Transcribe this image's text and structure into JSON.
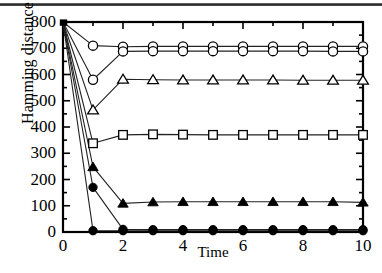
{
  "figure": {
    "background_color": "#ffffff",
    "axis_color": "#000000",
    "line_color": "#222222",
    "scan_artifact": "dark-horizontal-scan-line"
  },
  "axes": {
    "y_label": "Hamming distance",
    "x_label": "Time",
    "y_ticks": [
      0,
      100,
      200,
      300,
      400,
      500,
      600,
      700,
      800
    ],
    "y_tick_labels": [
      "0",
      "100",
      "200",
      "300",
      "400",
      "500",
      "600",
      "700",
      "800"
    ],
    "y_minor_step": 50,
    "x_ticks": [
      0,
      2,
      4,
      6,
      8,
      10
    ],
    "x_tick_labels": [
      "0",
      "2",
      "4",
      "6",
      "8",
      "10"
    ],
    "x_minor_step": 1,
    "ylim": [
      0,
      800
    ],
    "xlim": [
      0,
      10
    ],
    "frame": "box",
    "tick_direction": "in",
    "grid": false
  },
  "chart_data": {
    "type": "line",
    "title": "",
    "xlabel": "Time",
    "ylabel": "Hamming distance",
    "xlim": [
      0,
      10
    ],
    "ylim": [
      0,
      800
    ],
    "grid": false,
    "legend": "none",
    "x": [
      0,
      1,
      2,
      3,
      4,
      5,
      6,
      7,
      8,
      9,
      10
    ],
    "series": [
      {
        "name": "open-circle-upper",
        "marker": "circle-open",
        "values": [
          800,
          710,
          706,
          707,
          707,
          707,
          707,
          707,
          707,
          707,
          707
        ]
      },
      {
        "name": "open-circle-lower",
        "marker": "circle-open",
        "values": [
          800,
          580,
          688,
          689,
          689,
          689,
          689,
          689,
          689,
          688,
          688
        ]
      },
      {
        "name": "open-triangle",
        "marker": "triangle-open",
        "values": [
          800,
          465,
          582,
          580,
          579,
          579,
          579,
          579,
          578,
          578,
          578
        ]
      },
      {
        "name": "open-square",
        "marker": "square-open",
        "values": [
          800,
          338,
          370,
          372,
          371,
          370,
          370,
          370,
          370,
          370,
          370
        ]
      },
      {
        "name": "filled-triangle",
        "marker": "triangle-filled",
        "values": [
          800,
          248,
          109,
          114,
          115,
          115,
          115,
          115,
          115,
          115,
          113
        ]
      },
      {
        "name": "filled-circle-mid",
        "marker": "circle-filled",
        "values": [
          800,
          170,
          10,
          9,
          9,
          9,
          9,
          9,
          9,
          9,
          9
        ]
      },
      {
        "name": "filled-circle-zero",
        "marker": "circle-filled",
        "values": [
          800,
          5,
          5,
          5,
          5,
          5,
          5,
          5,
          5,
          5,
          5
        ]
      }
    ]
  }
}
